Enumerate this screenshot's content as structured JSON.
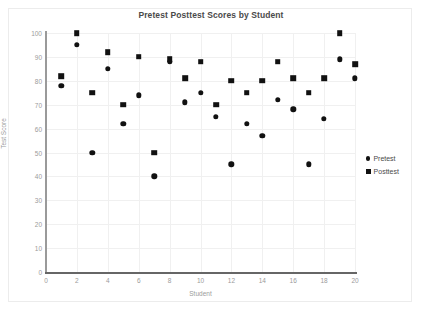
{
  "chart_data": {
    "type": "scatter",
    "title": "Pretest Posttest Scores by Student",
    "xlabel": "Student",
    "ylabel": "Test Score",
    "xlim": [
      0,
      20
    ],
    "ylim": [
      0,
      100
    ],
    "x_ticks": [
      0,
      2,
      4,
      6,
      8,
      10,
      12,
      14,
      16,
      18,
      20
    ],
    "y_ticks": [
      0,
      10,
      20,
      30,
      40,
      50,
      60,
      70,
      80,
      90,
      100
    ],
    "grid": true,
    "legend_position": "right",
    "marker_color": "#111111",
    "x": [
      1,
      2,
      3,
      4,
      5,
      6,
      7,
      8,
      9,
      10,
      11,
      12,
      13,
      14,
      15,
      16,
      17,
      18,
      19,
      20
    ],
    "series": [
      {
        "name": "Pretest",
        "marker": "circle",
        "values": [
          78,
          95,
          50,
          85,
          62,
          74,
          40,
          88,
          71,
          75,
          65,
          45,
          62,
          57,
          72,
          68,
          45,
          64,
          89,
          81
        ]
      },
      {
        "name": "Posttest",
        "marker": "square",
        "values": [
          82,
          100,
          75,
          92,
          70,
          90,
          50,
          89,
          81,
          88,
          70,
          80,
          75,
          80,
          88,
          81,
          75,
          81,
          100,
          87
        ]
      }
    ]
  },
  "legend": {
    "items": [
      {
        "label": "Pretest",
        "marker": "circle"
      },
      {
        "label": "Posttest",
        "marker": "square"
      }
    ]
  }
}
